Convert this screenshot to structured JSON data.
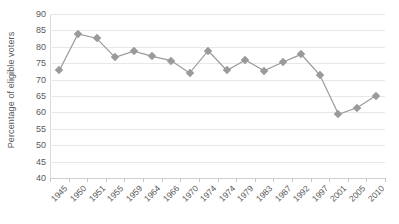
{
  "chart_data": {
    "type": "line",
    "title": "",
    "subtitle": "",
    "xlabel": "",
    "ylabel": "Percentage of eligible voters",
    "ylim": [
      40,
      90
    ],
    "ytick_step": 5,
    "yticks": [
      90,
      85,
      80,
      75,
      70,
      65,
      60,
      55,
      50,
      45,
      40
    ],
    "ytick_labels": [
      "90",
      "85",
      "80",
      "75",
      "70",
      "65",
      "60",
      "55",
      "50",
      "45",
      "40"
    ],
    "grid": true,
    "grid_axis": "y",
    "legend": false,
    "legend_position": "none",
    "marker": "diamond",
    "categories": [
      "1945",
      "1950",
      "1951",
      "1955",
      "1959",
      "1964",
      "1966",
      "1970",
      "1974",
      "1974",
      "1979",
      "1983",
      "1987",
      "1992",
      "1997",
      "2001",
      "2005",
      "2010"
    ],
    "values": [
      72.8,
      83.9,
      82.6,
      76.8,
      78.7,
      77.1,
      75.8,
      72.0,
      78.8,
      72.8,
      76.0,
      72.7,
      75.3,
      77.7,
      71.4,
      59.4,
      61.4,
      65.1
    ],
    "series": [
      {
        "name": "Turnout",
        "color": "#9a9a9a",
        "values": [
          72.8,
          83.9,
          82.6,
          76.8,
          78.7,
          77.1,
          75.8,
          72.0,
          78.8,
          72.8,
          76.0,
          72.7,
          75.3,
          77.7,
          71.4,
          59.4,
          61.4,
          65.1
        ]
      }
    ],
    "colors": {
      "line": "#9a9a9a",
      "marker": "#9a9a9a",
      "grid": "#e8e8e8",
      "axis": "#d0d0d0",
      "text": "#595959",
      "background": "#ffffff"
    }
  }
}
